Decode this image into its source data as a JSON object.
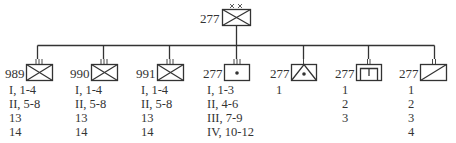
{
  "parent": {
    "id": "277",
    "echelon_marker": "xx",
    "symbol": "infantry"
  },
  "children": [
    {
      "id": "989",
      "echelon_marker": "III",
      "symbol": "infantry",
      "lines": [
        "I, 1-4",
        "II, 5-8",
        "13",
        "14"
      ]
    },
    {
      "id": "990",
      "echelon_marker": "III",
      "symbol": "infantry",
      "lines": [
        "I, 1-4",
        "II, 5-8",
        "13",
        "14"
      ]
    },
    {
      "id": "991",
      "echelon_marker": "III",
      "symbol": "infantry",
      "lines": [
        "I, 1-4",
        "II, 5-8",
        "13",
        "14"
      ]
    },
    {
      "id": "277",
      "echelon_marker": "III",
      "symbol": "artillery",
      "lines": [
        "I, 1-3",
        "II, 4-6",
        "III, 7-9",
        "IV, 10-12"
      ]
    },
    {
      "id": "277",
      "echelon_marker": "I",
      "symbol": "antitank",
      "lines": [
        "1"
      ]
    },
    {
      "id": "277",
      "echelon_marker": "I",
      "symbol": "engineer",
      "lines": [
        "1",
        "2",
        "3"
      ]
    },
    {
      "id": "277",
      "echelon_marker": "I",
      "symbol": "reconnaissance",
      "lines": [
        "1",
        "2",
        "3",
        "4"
      ]
    }
  ],
  "colors": {
    "line": "#333333",
    "background": "#ffffff"
  }
}
